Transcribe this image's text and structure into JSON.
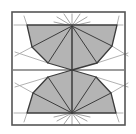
{
  "figure": {
    "width": 136,
    "height": 134,
    "background": "#ffffff",
    "frame": {
      "x": 12,
      "y": 12,
      "w": 113,
      "h": 113,
      "stroke": "#555555",
      "stroke_width": 1.6
    },
    "colors": {
      "fill": "#b4b4b4",
      "edge": "#3c3c3c",
      "ray": "#9a9a9a",
      "light_line": "#a8a8a8"
    },
    "center": [
      72,
      70
    ],
    "top_apex": [
      72,
      26
    ],
    "bottom_apex": [
      72,
      113
    ],
    "top_polygon": [
      [
        27,
        25
      ],
      [
        32,
        47
      ],
      [
        48,
        63
      ],
      [
        72,
        70
      ],
      [
        97,
        63
      ],
      [
        112,
        46
      ],
      [
        117,
        25
      ]
    ],
    "bottom_polygon": [
      [
        27,
        113
      ],
      [
        33,
        93
      ],
      [
        48,
        77
      ],
      [
        72,
        70
      ],
      [
        96,
        77
      ],
      [
        111,
        93
      ],
      [
        116,
        113
      ]
    ],
    "top_fan_spokes": [
      [
        32,
        47
      ],
      [
        48,
        63
      ],
      [
        72,
        70
      ],
      [
        97,
        63
      ],
      [
        112,
        46
      ]
    ],
    "bottom_fan_spokes": [
      [
        33,
        93
      ],
      [
        48,
        77
      ],
      [
        72,
        70
      ],
      [
        96,
        77
      ],
      [
        111,
        93
      ]
    ],
    "midline": {
      "x1": 13,
      "y1": 70,
      "x2": 124,
      "y2": 70
    },
    "extension_lines": [
      [
        [
          14,
          25
        ],
        [
          27,
          25
        ]
      ],
      [
        [
          117,
          25
        ],
        [
          123,
          25
        ]
      ],
      [
        [
          14,
          113
        ],
        [
          27,
          113
        ]
      ],
      [
        [
          116,
          113
        ],
        [
          123,
          113
        ]
      ],
      [
        [
          24,
          16
        ],
        [
          27,
          25
        ]
      ],
      [
        [
          119,
          16
        ],
        [
          117,
          25
        ]
      ],
      [
        [
          24,
          122
        ],
        [
          27,
          113
        ]
      ],
      [
        [
          119,
          122
        ],
        [
          116,
          113
        ]
      ],
      [
        [
          15,
          56
        ],
        [
          32,
          47
        ]
      ],
      [
        [
          15,
          52
        ],
        [
          48,
          63
        ]
      ],
      [
        [
          128,
          56
        ],
        [
          112,
          46
        ]
      ],
      [
        [
          128,
          53
        ],
        [
          97,
          63
        ]
      ],
      [
        [
          15,
          83
        ],
        [
          33,
          93
        ]
      ],
      [
        [
          15,
          87
        ],
        [
          48,
          77
        ]
      ],
      [
        [
          128,
          83
        ],
        [
          111,
          93
        ]
      ],
      [
        [
          128,
          87
        ],
        [
          96,
          77
        ]
      ]
    ],
    "top_rays": [
      [
        [
          72,
          26
        ],
        [
          72,
          14
        ]
      ],
      [
        [
          72,
          26
        ],
        [
          64,
          14
        ]
      ],
      [
        [
          72,
          26
        ],
        [
          80,
          14
        ]
      ],
      [
        [
          72,
          26
        ],
        [
          57,
          17
        ]
      ],
      [
        [
          72,
          26
        ],
        [
          87,
          17
        ]
      ],
      [
        [
          72,
          26
        ],
        [
          54,
          22
        ]
      ],
      [
        [
          72,
          26
        ],
        [
          90,
          22
        ]
      ]
    ],
    "bottom_rays": [
      [
        [
          72,
          113
        ],
        [
          72,
          125
        ]
      ],
      [
        [
          72,
          113
        ],
        [
          64,
          124
        ]
      ],
      [
        [
          72,
          113
        ],
        [
          80,
          124
        ]
      ],
      [
        [
          72,
          113
        ],
        [
          57,
          121
        ]
      ],
      [
        [
          72,
          113
        ],
        [
          87,
          121
        ]
      ],
      [
        [
          72,
          113
        ],
        [
          54,
          117
        ]
      ],
      [
        [
          72,
          113
        ],
        [
          90,
          117
        ]
      ]
    ]
  }
}
